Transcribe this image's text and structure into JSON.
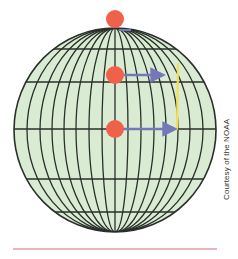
{
  "diagram": {
    "colors": {
      "globe_fill": "#d9ecd3",
      "grid_line": "#2a2f2a",
      "dot": "#f0604a",
      "arrow": "#7477b8",
      "yellow_line": "#f5dc5a",
      "rule": "#d46a78"
    },
    "globe": {
      "cx": 115,
      "cy": 130,
      "rx": 101,
      "ry": 102
    },
    "latitude_lines_y": [
      49,
      82,
      129,
      179,
      212
    ],
    "dots": [
      {
        "name": "pole-dot",
        "x": 115,
        "y": 19
      },
      {
        "name": "midlatitude-dot",
        "x": 115,
        "y": 75
      },
      {
        "name": "equator-dot",
        "x": 115,
        "y": 129
      }
    ],
    "arrows": [
      {
        "name": "midlatitude-arrow",
        "x1": 124,
        "y1": 75,
        "x2": 166,
        "y2": 75
      },
      {
        "name": "equator-arrow",
        "x1": 124,
        "y1": 129,
        "x2": 178,
        "y2": 129
      }
    ],
    "yellow_line": {
      "x1": 178,
      "y1": 63,
      "x2": 177,
      "y2": 130
    }
  },
  "credit": "Courtesy of the NOAA"
}
